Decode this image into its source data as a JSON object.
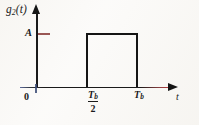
{
  "figure": {
    "y_axis_label": "g",
    "y_axis_label_sub": "2",
    "y_axis_label_arg": "(t)",
    "amplitude_label": "A",
    "origin_label": "0",
    "x_axis_label": "t",
    "tick_tb_half_numerator": "T",
    "tick_tb_half_numerator_sub": "b",
    "tick_tb_half_denominator": "2",
    "tick_tb_label": "T",
    "tick_tb_label_sub": "b"
  },
  "colors": {
    "ink": "#1a1a1a",
    "amplitude_tick": "#9a5755",
    "axis_accent_red": "#b4383a",
    "axis_accent_blue": "#3a4a74",
    "background": "#fbfaf8"
  },
  "chart_data": {
    "type": "line",
    "title": "",
    "xlabel": "t",
    "ylabel": "g2(t)",
    "xtick_labels": [
      "0",
      "Tb/2",
      "Tb"
    ],
    "xtick_values": [
      0,
      0.5,
      1.0
    ],
    "ytick_labels": [
      "A"
    ],
    "ytick_values": [
      1.0
    ],
    "xlim": [
      -0.18,
      1.62
    ],
    "ylim": [
      0,
      1.22
    ],
    "grid": false,
    "legend": "none",
    "series": [
      {
        "name": "g2(t)",
        "x": [
          0,
          0.5,
          0.5,
          1.0,
          1.0,
          1.45
        ],
        "values": [
          0,
          0,
          1.0,
          1.0,
          0,
          0
        ],
        "description": "rectangular pulse of amplitude A between Tb/2 and Tb"
      }
    ]
  }
}
